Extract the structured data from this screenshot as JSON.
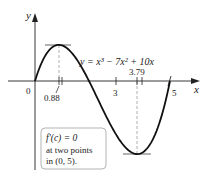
{
  "chart_data": {
    "type": "line",
    "title": "",
    "function": "y = x^3 - 7x^2 + 10x",
    "equation_label": "y = x³ − 7x² + 10x",
    "xlabel": "x",
    "ylabel": "y",
    "xlim": [
      0,
      5
    ],
    "x_ticks": [
      {
        "value": 0,
        "label": "0"
      },
      {
        "value": 0.88,
        "label": "0.88"
      },
      {
        "value": 3,
        "label": "3"
      },
      {
        "value": 3.79,
        "label": "3.79"
      },
      {
        "value": 5,
        "label": "5"
      }
    ],
    "critical_points": [
      {
        "x": 0.88,
        "y": 4.06,
        "type": "max"
      },
      {
        "x": 3.79,
        "y": -8.21,
        "type": "min"
      }
    ],
    "roots": [
      0,
      2,
      5
    ],
    "grid": false
  },
  "labels": {
    "y_axis": "y",
    "x_axis": "x",
    "origin": "0",
    "tick_088": "0.88",
    "tick_3": "3",
    "tick_379": "3.79",
    "tick_5": "5",
    "equation": "y = x³ − 7x² + 10x"
  },
  "note_box": {
    "line1": "f′(c) = 0",
    "line2": "at two points",
    "line3": "in (0, 5)."
  },
  "colors": {
    "curve": "#111111",
    "axis": "#222222",
    "dashed": "#999999",
    "box_border": "#aaaaaa",
    "tangent": "#555555"
  }
}
